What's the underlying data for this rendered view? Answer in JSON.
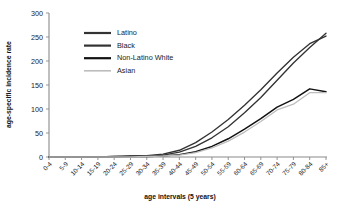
{
  "chart_data": {
    "type": "line",
    "title": "",
    "xlabel": "age intervals (5 years)",
    "ylabel": "age-specific incidence rate",
    "categories": [
      "0-4",
      "5-9",
      "10-14",
      "15-19",
      "20-24",
      "25-29",
      "30-34",
      "35-39",
      "40-44",
      "45-49",
      "50-54",
      "55-59",
      "60-64",
      "65-69",
      "70-74",
      "75-79",
      "80-84",
      "85+"
    ],
    "ylim": [
      0,
      300
    ],
    "yticks": [
      0,
      50,
      100,
      150,
      200,
      250,
      300
    ],
    "grid": false,
    "legend_position": "top-left",
    "series": [
      {
        "name": "Latino",
        "color": "#333333",
        "values": [
          0,
          0,
          0,
          0,
          1,
          2,
          3,
          6,
          14,
          30,
          52,
          78,
          108,
          140,
          175,
          208,
          236,
          252
        ]
      },
      {
        "name": "Black",
        "color": "#333333",
        "values": [
          0,
          0,
          0,
          0,
          1,
          1,
          2,
          4,
          10,
          22,
          40,
          63,
          92,
          124,
          160,
          196,
          228,
          258
        ]
      },
      {
        "name": "Non-Latino White",
        "color": "#111111",
        "values": [
          0,
          0,
          0,
          0,
          0,
          1,
          1,
          2,
          5,
          11,
          22,
          38,
          58,
          80,
          104,
          120,
          142,
          136
        ]
      },
      {
        "name": "Asian",
        "color": "#bdbdbd",
        "values": [
          0,
          0,
          0,
          0,
          0,
          0,
          1,
          2,
          4,
          9,
          19,
          33,
          52,
          74,
          98,
          110,
          134,
          134
        ]
      }
    ]
  },
  "legend": {
    "items": [
      {
        "label": "Latino"
      },
      {
        "label": "Black"
      },
      {
        "label": "Non-Latino White"
      },
      {
        "label": "Asian"
      }
    ]
  }
}
